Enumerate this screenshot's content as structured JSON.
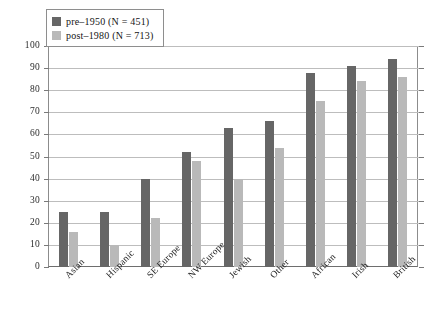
{
  "legend": {
    "position": "top-left",
    "entries": [
      {
        "label": "pre–1950 (N = 451)",
        "color": "#666666",
        "swatch": "pre-1950-swatch"
      },
      {
        "label": "post–1980 (N = 713)",
        "color": "#b9b9b9",
        "swatch": "post-1980-swatch"
      }
    ]
  },
  "axis": {
    "y_ticks": [
      "100",
      "90",
      "80",
      "70",
      "60",
      "50",
      "40",
      "30",
      "20",
      "10",
      "0"
    ]
  },
  "chart_data": {
    "type": "bar",
    "title": "",
    "xlabel": "",
    "ylabel": "",
    "ylim": [
      0,
      100
    ],
    "ytick_step": 10,
    "grid": true,
    "legend_position": "top-left",
    "categories": [
      "Asian",
      "Hispanic",
      "SE Europe",
      "NW Europe",
      "Jewish",
      "Other",
      "African",
      "Irish",
      "British"
    ],
    "series": [
      {
        "name": "pre–1950 (N = 451)",
        "color": "#666666",
        "values": [
          25,
          25,
          40,
          52,
          63,
          66,
          88,
          91,
          94
        ]
      },
      {
        "name": "post–1980 (N = 713)",
        "color": "#b9b9b9",
        "values": [
          16,
          10,
          22,
          48,
          40,
          54,
          75,
          84,
          86
        ]
      }
    ]
  }
}
